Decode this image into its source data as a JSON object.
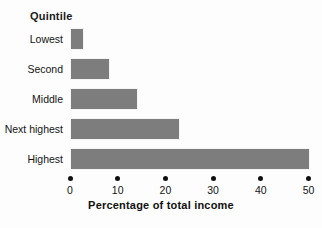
{
  "chart_data": {
    "type": "bar",
    "orientation": "horizontal",
    "title": "",
    "category_axis_title": "Quintile",
    "xlabel": "Percentage of total income",
    "ylabel": "Quintile",
    "categories": [
      "Lowest",
      "Second",
      "Middle",
      "Next highest",
      "Highest"
    ],
    "values": [
      3.0,
      8.4,
      14.3,
      23.1,
      50.3
    ],
    "series": [
      {
        "name": "Percentage of total income",
        "values": [
          3.0,
          8.4,
          14.3,
          23.1,
          50.3
        ]
      }
    ],
    "xlim": [
      0,
      50
    ],
    "xticks": [
      0,
      10,
      20,
      30,
      40,
      50
    ],
    "xtick_labels": [
      "0",
      "10",
      "20",
      "30",
      "40",
      "50"
    ],
    "grid": false,
    "legend": "none",
    "bar_color": "#7d7d7d",
    "axis_color": "#111111",
    "background_color": "#fdfdfd"
  },
  "labels": {
    "quintile_heading": "Quintile",
    "x_axis_title": "Percentage of total income",
    "categories": [
      "Lowest",
      "Second",
      "Middle",
      "Next highest",
      "Highest"
    ],
    "xtick_labels": [
      "0",
      "10",
      "20",
      "30",
      "40",
      "50"
    ]
  }
}
